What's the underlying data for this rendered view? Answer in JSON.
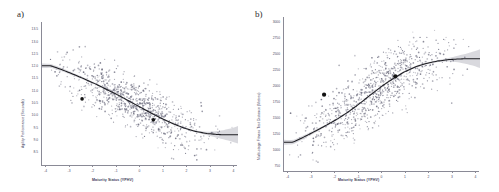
{
  "figure": {
    "panels": [
      {
        "id": "a",
        "label": "a)",
        "ylabel": "Agility Performance (Seconds)",
        "xlabel": "Maturity Status (YPHV)"
      },
      {
        "id": "b",
        "label": "b)",
        "ylabel": "Multi-stage Fitness Test Distance (Metres)",
        "xlabel": "Maturity Status (YPHV)"
      }
    ]
  },
  "chart_data": [
    {
      "type": "scatter",
      "panel": "a",
      "title": "",
      "xlabel": "Maturity Status (YPHV)",
      "ylabel": "Agility Performance (Seconds)",
      "xlim": [
        -4.4,
        4.4
      ],
      "ylim": [
        8.3,
        13.75
      ],
      "xticks": [
        -4,
        -3,
        -2,
        -1,
        0,
        1,
        2,
        3,
        4
      ],
      "yticks": [
        8.5,
        9.0,
        9.5,
        10.0,
        10.5,
        11.0,
        11.5,
        12.0,
        12.5,
        13.0,
        13.5
      ],
      "xtick_labels": [
        "-4",
        "-3",
        "-2",
        "-1",
        "0",
        "1",
        "2",
        "3",
        "4"
      ],
      "ytick_labels": [
        "8.5",
        "9.0",
        "9.5",
        "10.0",
        "10.5",
        "11.0",
        "11.5",
        "12.0",
        "12.5",
        "13.0",
        "13.5"
      ],
      "grid": false,
      "legend": "none",
      "n_points": 900,
      "point_color": "#8e8e9c",
      "fit_color": "#1d1d22",
      "ci_color": "#b9b9c2",
      "fit_description": "decreasing curvilinear fit, plateaus at right",
      "fit_curve": {
        "x": [
          -4.0,
          -3.5,
          -3.0,
          -2.5,
          -2.0,
          -1.5,
          -1.0,
          -0.5,
          0.0,
          0.5,
          1.0,
          1.5,
          2.0,
          2.5,
          3.0,
          3.5,
          4.0
        ],
        "y": [
          12.08,
          11.93,
          11.76,
          11.58,
          11.39,
          11.18,
          10.97,
          10.74,
          10.51,
          10.28,
          10.06,
          9.87,
          9.7,
          9.58,
          9.5,
          9.46,
          9.45
        ]
      },
      "highlighted_points": [
        {
          "x": -2.6,
          "y": 10.82
        },
        {
          "x": 0.6,
          "y": 10.02
        }
      ]
    },
    {
      "type": "scatter",
      "panel": "b",
      "title": "",
      "xlabel": "Maturity Status (YPHV)",
      "ylabel": "Multi-stage Fitness Test Distance (Metres)",
      "xlim": [
        -4.4,
        4.4
      ],
      "ylim": [
        620,
        3060
      ],
      "xticks": [
        -4,
        -3,
        -2,
        -1,
        0,
        1,
        2,
        3,
        4
      ],
      "yticks": [
        750,
        1000,
        1250,
        1500,
        1750,
        2000,
        2250,
        2500,
        2750,
        3000
      ],
      "xtick_labels": [
        "-4",
        "-3",
        "-2",
        "-1",
        "0",
        "1",
        "2",
        "3",
        "4"
      ],
      "ytick_labels": [
        "750",
        "1000",
        "1250",
        "1500",
        "1750",
        "2000",
        "2250",
        "2500",
        "2750",
        "3000"
      ],
      "grid": false,
      "legend": "none",
      "n_points": 900,
      "point_color": "#8e8e9c",
      "fit_color": "#1d1d22",
      "ci_color": "#b9b9c2",
      "fit_description": "increasing curvilinear fit, plateaus at right",
      "fit_curve": {
        "x": [
          -4.0,
          -3.5,
          -3.0,
          -2.5,
          -2.0,
          -1.5,
          -1.0,
          -0.5,
          0.0,
          0.5,
          1.0,
          1.5,
          2.0,
          2.5,
          3.0,
          3.5,
          4.0
        ],
        "y": [
          1075,
          1160,
          1250,
          1345,
          1445,
          1560,
          1690,
          1830,
          1965,
          2085,
          2190,
          2270,
          2325,
          2362,
          2385,
          2396,
          2400
        ]
      },
      "highlighted_points": [
        {
          "x": -2.6,
          "y": 1830
        },
        {
          "x": 0.6,
          "y": 2120
        }
      ]
    }
  ]
}
